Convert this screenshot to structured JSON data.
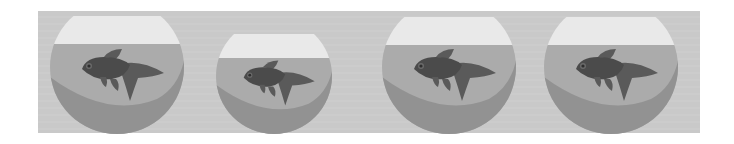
{
  "scene": {
    "description": "Four fishbowls, each containing one dark fish",
    "colors": {
      "background": "#ffffff",
      "panel": "#c9c9c9",
      "air": "#e9e9e9",
      "water": "#ababab",
      "shadow": "#929292",
      "fish": "#4b4b4b",
      "fin": "#5a5a5a",
      "eye": "#2e2e2e"
    },
    "bowls": [
      {
        "cx": 117,
        "cy": 67,
        "r": 67,
        "rim_y": 16,
        "water_y": 44
      },
      {
        "cx": 274,
        "cy": 76,
        "r": 58,
        "rim_y": 34,
        "water_y": 58
      },
      {
        "cx": 449,
        "cy": 67,
        "r": 67,
        "rim_y": 17,
        "water_y": 45
      },
      {
        "cx": 611,
        "cy": 67,
        "r": 67,
        "rim_y": 17,
        "water_y": 45
      }
    ]
  }
}
